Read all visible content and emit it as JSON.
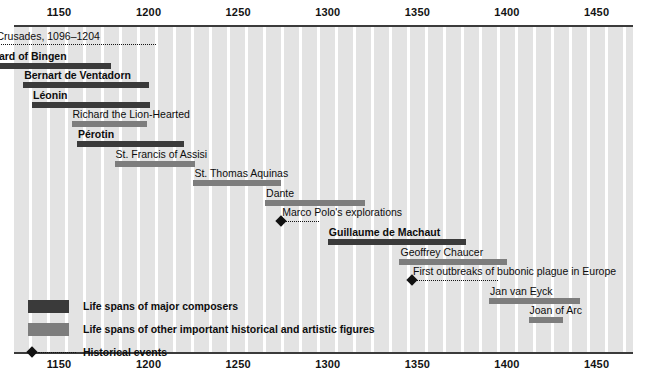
{
  "chart_data": {
    "type": "timeline",
    "title": "",
    "xlabel": "",
    "xlim": [
      1096,
      1460
    ],
    "axis_ticks": [
      1150,
      1200,
      1250,
      1300,
      1350,
      1400,
      1450
    ],
    "grid": true,
    "legend_position": "bottom-left",
    "legend": [
      {
        "key": "composer",
        "label": "Life spans of major composers",
        "color": "#3a3a3a"
      },
      {
        "key": "figure",
        "label": "Life spans of other important historical and artistic figures",
        "color": "#7d7d7d"
      },
      {
        "key": "event",
        "label": "Historical events",
        "color": "#111111"
      }
    ],
    "entries": [
      {
        "label": "Age of Crusades, 1096–1204",
        "type": "era",
        "start": 1096,
        "end": 1204,
        "bold": false
      },
      {
        "label": "Hildegard of Bingen",
        "type": "composer",
        "start": 1098,
        "end": 1179,
        "bold": true
      },
      {
        "label": "Bernart de Ventadorn",
        "type": "composer",
        "start": 1130,
        "end": 1200,
        "bold": true
      },
      {
        "label": "Léonin",
        "type": "composer",
        "start": 1135,
        "end": 1201,
        "bold": true
      },
      {
        "label": "Richard the Lion-Hearted",
        "type": "figure",
        "start": 1157,
        "end": 1199,
        "bold": false
      },
      {
        "label": "Pérotin",
        "type": "composer",
        "start": 1160,
        "end": 1220,
        "bold": true
      },
      {
        "label": "St. Francis of Assisi",
        "type": "figure",
        "start": 1181,
        "end": 1226,
        "bold": false
      },
      {
        "label": "St. Thomas Aquinas",
        "type": "figure",
        "start": 1225,
        "end": 1274,
        "bold": false
      },
      {
        "label": "Dante",
        "type": "figure",
        "start": 1265,
        "end": 1321,
        "bold": false
      },
      {
        "label": "Marco Polo's explorations",
        "type": "event",
        "start": 1274,
        "end": 1295,
        "bold": false
      },
      {
        "label": "Guillaume de Machaut",
        "type": "composer",
        "start": 1300,
        "end": 1377,
        "bold": true
      },
      {
        "label": "Geoffrey Chaucer",
        "type": "figure",
        "start": 1340,
        "end": 1400,
        "bold": false
      },
      {
        "label": "First outbreaks of bubonic plague in Europe",
        "type": "event",
        "start": 1347,
        "end": 1395,
        "bold": false
      },
      {
        "label": "Jan van Eyck",
        "type": "figure",
        "start": 1390,
        "end": 1441,
        "bold": false
      },
      {
        "label": "Joan of Arc",
        "type": "figure",
        "start": 1412,
        "end": 1431,
        "bold": false
      }
    ]
  }
}
